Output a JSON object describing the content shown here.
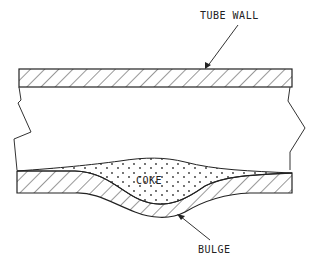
{
  "diagram": {
    "labels": {
      "tube_wall": "TUBE WALL",
      "coke": "COKE",
      "bulge": "BULGE"
    },
    "colors": {
      "line": "#222222",
      "background": "#ffffff"
    }
  }
}
